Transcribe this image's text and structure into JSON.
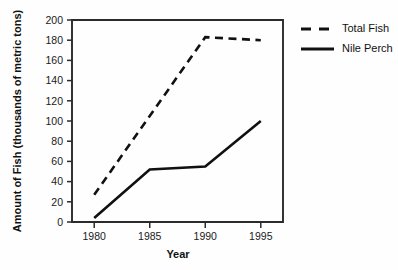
{
  "chart_data": {
    "type": "line",
    "title": "",
    "xlabel": "Year",
    "ylabel": "Amount of Fish (thousands of metric tons)",
    "x": [
      1980,
      1985,
      1990,
      1995
    ],
    "xticklabels": [
      "1980",
      "1985",
      "1990",
      "1995"
    ],
    "yticks": [
      0,
      20,
      40,
      60,
      80,
      100,
      120,
      140,
      160,
      180,
      200
    ],
    "yticklabels": [
      "0",
      "20",
      "40",
      "60",
      "80",
      "100",
      "120",
      "140",
      "160",
      "180",
      "200"
    ],
    "xlim": [
      1978,
      1997
    ],
    "ylim": [
      0,
      200
    ],
    "grid": false,
    "legend_position": "right",
    "series": [
      {
        "name": "Total Fish",
        "style": "dashed",
        "color": "#111111",
        "values": [
          27,
          105,
          183,
          180
        ]
      },
      {
        "name": "Nile Perch",
        "style": "solid",
        "color": "#111111",
        "values": [
          4,
          52,
          55,
          100
        ]
      }
    ]
  },
  "legend": {
    "entries": [
      {
        "label": "Total Fish",
        "style": "dashed"
      },
      {
        "label": "Nile Perch",
        "style": "solid"
      }
    ]
  },
  "colors": {
    "ink": "#111111",
    "axis": "#2b2b2b",
    "background": "#fefefe"
  }
}
